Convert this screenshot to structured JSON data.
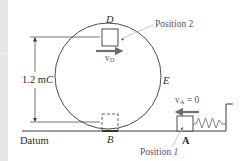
{
  "figure": {
    "labels": {
      "point_d": "D",
      "point_e": "E",
      "point_b": "B",
      "point_a": "A",
      "point_c": "C",
      "height_value": "1.2 m",
      "datum": "Datum",
      "position_1": "Position",
      "position_1_num": "1",
      "position_2": "Position 2",
      "velocity_d_symbol": "v",
      "velocity_d_sub": "D",
      "velocity_a_symbol": "v",
      "velocity_a_sub": "A",
      "velocity_a_value": " = 0"
    },
    "colors": {
      "line": "#3a3a3a",
      "arrow": "#6e6e6e",
      "leader": "#b0b0b0",
      "strip": "#e6e6e6"
    },
    "geometry": {
      "loop_center": [
        108,
        76
      ],
      "loop_radius": 53,
      "ground_y": 131
    }
  }
}
